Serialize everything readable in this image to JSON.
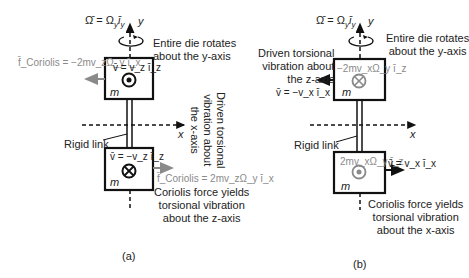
{
  "panel_a": {
    "caption": "(a)",
    "omega_eq": "Ω̄ = Ω_y ī_y",
    "omega_label": "Ω̄ = Ωᵧ īᵧ",
    "y_axis": "y",
    "x_axis": "x",
    "rotation_note": [
      "Entire die rotates",
      "about the y-axis"
    ],
    "top_mass": {
      "velocity": "v̄ = v_z ī_z",
      "velocity_label": "v̄ = v_z ī_z",
      "symbol": "dot",
      "mass": "m"
    },
    "top_coriolis": "f̄_Coriolis = −2mv_zΩ_y ī_x",
    "bottom_mass": {
      "velocity": "v̄ = −v_z ī_z",
      "symbol": "cross",
      "mass": "m"
    },
    "bottom_coriolis": "f̄_Coriolis = 2mv_zΩ_y ī_x",
    "rigid_link": "Rigid link",
    "driven_note": [
      "Driven torsional",
      "vibration about",
      "the x-axis"
    ],
    "result_note": [
      "Coriolis force yields",
      "torsional vibration",
      "about the z-axis"
    ]
  },
  "panel_b": {
    "caption": "(b)",
    "omega_eq": "Ω̄ = Ω_y ī_y",
    "y_axis": "y",
    "x_axis": "x",
    "rotation_note": [
      "Entire die rotates",
      "about the y-axis"
    ],
    "driven_note": [
      "Driven torsional",
      "vibration about",
      "the z-axis"
    ],
    "top_mass": {
      "velocity": "v̄ = −v_x ī_x",
      "coriolis": "−2mv_xΩ_y ī_z",
      "symbol": "cross",
      "mass": "m"
    },
    "bottom_mass": {
      "velocity": "v̄ = v_x ī_x",
      "coriolis": "2mv_xΩ_y ī_z",
      "symbol": "dot",
      "mass": "m"
    },
    "rigid_link": "Rigid link",
    "result_note": [
      "Coriolis force yields",
      "torsional vibration",
      "about the x-axis"
    ]
  },
  "colors": {
    "line": "#111111",
    "coriolis_gray": "#8a8a8a",
    "background": "#ffffff"
  }
}
